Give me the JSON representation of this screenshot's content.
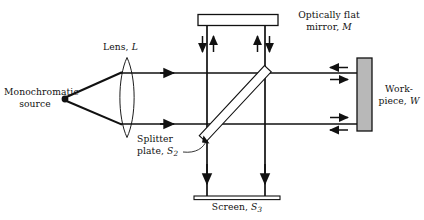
{
  "figure": {
    "type": "optics-ray-diagram",
    "title_text": "",
    "background_color": "#ffffff",
    "line_color": "#111111",
    "workpiece_fill": "#b8b8b8",
    "mirror_fill": "#ffffff"
  },
  "labels": {
    "source": {
      "line1": "Monochromatic",
      "line2": "source"
    },
    "lens": {
      "text": "Lens,",
      "symbol": "L"
    },
    "mirror": {
      "line1": "Optically flat",
      "line2_text": "mirror,",
      "line2_symbol": "M"
    },
    "workpiece": {
      "line1": "Work-",
      "line2_text": "piece,",
      "line2_symbol": "W"
    },
    "splitter": {
      "line1": "Splitter",
      "line2_text": "plate,",
      "line2_symbol": "S",
      "line2_sub": "2"
    },
    "screen": {
      "text": "Screen,",
      "symbol": "S",
      "sub": "3"
    }
  },
  "components": [
    {
      "name": "monochromatic-source",
      "shape": "point",
      "x": 65,
      "y": 99
    },
    {
      "name": "lens",
      "shape": "biconvex",
      "cx": 127,
      "top": 58,
      "bottom": 137
    },
    {
      "name": "beam-splitter",
      "shape": "tilted-plate",
      "x1": 203,
      "y1": 131,
      "x2": 268,
      "y2": 69,
      "angle_deg": -45
    },
    {
      "name": "optically-flat-mirror",
      "shape": "horizontal-bar",
      "x": 198,
      "y": 15,
      "w": 80,
      "h": 11
    },
    {
      "name": "workpiece",
      "shape": "vertical-bar",
      "x": 357,
      "y": 58,
      "w": 15,
      "h": 73
    },
    {
      "name": "screen",
      "shape": "horizontal-bar",
      "x": 194,
      "y": 196,
      "w": 86,
      "h": 4
    }
  ],
  "beams": [
    {
      "name": "source-to-lens-upper",
      "from": [
        65,
        99
      ],
      "to": [
        121,
        73
      ]
    },
    {
      "name": "source-to-lens-lower",
      "from": [
        65,
        99
      ],
      "to": [
        121,
        124
      ]
    },
    {
      "name": "collimated-upper",
      "from": [
        121,
        73
      ],
      "to": [
        372,
        73
      ],
      "arrow": "right"
    },
    {
      "name": "collimated-lower",
      "from": [
        121,
        124
      ],
      "to": [
        372,
        124
      ],
      "arrow": "right"
    },
    {
      "name": "vertical-left",
      "from": [
        207,
        21
      ],
      "to": [
        207,
        196
      ],
      "arrows": [
        "down",
        "up",
        "down"
      ]
    },
    {
      "name": "vertical-right",
      "from": [
        265,
        21
      ],
      "to": [
        265,
        196
      ],
      "arrows": [
        "up",
        "down",
        "down"
      ]
    }
  ],
  "arrow_marks": [
    {
      "name": "arrow-upper-beam-right",
      "x": 171,
      "y": 73,
      "dir": "right"
    },
    {
      "name": "arrow-lower-beam-right",
      "x": 171,
      "y": 124,
      "dir": "right"
    },
    {
      "name": "arrow-workpiece-upper-in",
      "x": 334,
      "y": 68,
      "dir": "left"
    },
    {
      "name": "arrow-workpiece-upper-out",
      "x": 334,
      "y": 79,
      "dir": "right"
    },
    {
      "name": "arrow-workpiece-lower-in",
      "x": 334,
      "y": 118,
      "dir": "right"
    },
    {
      "name": "arrow-workpiece-lower-out",
      "x": 334,
      "y": 130,
      "dir": "left"
    },
    {
      "name": "arrow-mirror-left-down",
      "x": 203,
      "y": 45,
      "dir": "down"
    },
    {
      "name": "arrow-mirror-left-up",
      "x": 214,
      "y": 45,
      "dir": "up"
    },
    {
      "name": "arrow-mirror-right-up",
      "x": 258,
      "y": 45,
      "dir": "up"
    },
    {
      "name": "arrow-mirror-right-down",
      "x": 270,
      "y": 45,
      "dir": "down"
    },
    {
      "name": "arrow-screen-left-down",
      "x": 207,
      "y": 178,
      "dir": "down"
    },
    {
      "name": "arrow-screen-right-down",
      "x": 265,
      "y": 178,
      "dir": "down"
    }
  ]
}
